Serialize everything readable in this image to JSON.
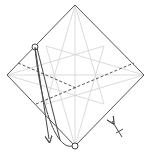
{
  "diagram": {
    "type": "origami-folding-step",
    "colors": {
      "background": "#ffffff",
      "outline": "#555555",
      "crease": "#cfcfcf",
      "valley_fold": "#555555",
      "arrow": "#444444"
    },
    "paper": {
      "shape": "square-diamond",
      "vertices": {
        "top": [
          75,
          5
        ],
        "right": [
          144,
          75
        ],
        "bottom": [
          75,
          146
        ],
        "left": [
          7,
          75
        ]
      }
    },
    "markers": [
      {
        "name": "reference-point-circle",
        "at": [
          35,
          47
        ]
      },
      {
        "name": "target-point-circle",
        "at": [
          75,
          146
        ]
      }
    ],
    "symbols": [
      "valley-fold-dashed-lines",
      "fold-arrow",
      "push-flip-arrow"
    ]
  }
}
